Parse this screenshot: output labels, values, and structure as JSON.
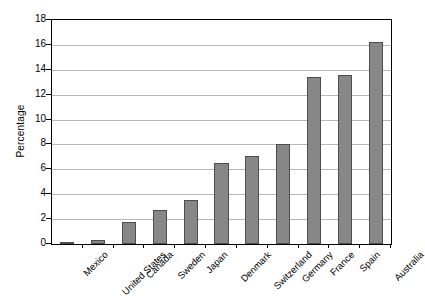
{
  "chart_data": {
    "type": "bar",
    "title": "",
    "subtitle": "",
    "xlabel": "",
    "ylabel": "Percentage",
    "ylim": [
      0,
      18
    ],
    "ytick_step": 2,
    "yticks": [
      0,
      2,
      4,
      6,
      8,
      10,
      12,
      14,
      16,
      18
    ],
    "ytick_labels": [
      "0",
      "2",
      "4",
      "6",
      "8",
      "10",
      "12",
      "14",
      "16",
      "18"
    ],
    "grid": "horizontal",
    "legend": "none",
    "categories": [
      "Mexico",
      "United States",
      "Canada",
      "Sweden",
      "Japan",
      "Denmark",
      "Switzerland",
      "Germany",
      "France",
      "Spain",
      "Australia"
    ],
    "values": [
      0.1,
      0.3,
      1.8,
      2.7,
      3.5,
      6.5,
      7.1,
      8.0,
      13.4,
      13.6,
      16.2
    ],
    "bar_color": "#878787",
    "bar_edge_color": "#4d4d4d",
    "gridline_color": "#b8b8b8",
    "axis_color": "#000000",
    "background_color": "#ffffff",
    "xlabel_rotation": -45
  }
}
